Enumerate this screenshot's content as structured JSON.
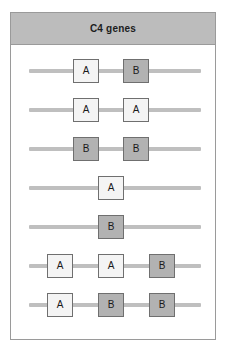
{
  "panel": {
    "title": "C4 genes",
    "header_color": "#bcbcbc",
    "border_color": "#9a9a9a",
    "background_color": "#ffffff"
  },
  "legend_colors": {
    "gene_A_fill": "#f4f4f4",
    "gene_B_fill": "#b2b2b2",
    "gene_border": "#6f6f6f",
    "chromosome_line": "#bfbfbf"
  },
  "chart_data": {
    "type": "diagram",
    "title": "C4 genes",
    "xlabel": "",
    "ylabel": "",
    "categories": [
      "haplotype-1",
      "haplotype-2",
      "haplotype-3",
      "haplotype-4",
      "haplotype-5",
      "haplotype-6",
      "haplotype-7"
    ],
    "haplotypes": [
      {
        "index": 1,
        "gene_count": 2,
        "genes": [
          {
            "label": "A",
            "type": "A",
            "left": 62
          },
          {
            "label": "B",
            "type": "B",
            "left": 112
          }
        ]
      },
      {
        "index": 2,
        "gene_count": 2,
        "genes": [
          {
            "label": "A",
            "type": "A",
            "left": 62
          },
          {
            "label": "A",
            "type": "A",
            "left": 112
          }
        ]
      },
      {
        "index": 3,
        "gene_count": 2,
        "genes": [
          {
            "label": "B",
            "type": "B",
            "left": 62
          },
          {
            "label": "B",
            "type": "B",
            "left": 112
          }
        ]
      },
      {
        "index": 4,
        "gene_count": 1,
        "genes": [
          {
            "label": "A",
            "type": "A",
            "left": 87
          }
        ]
      },
      {
        "index": 5,
        "gene_count": 1,
        "genes": [
          {
            "label": "B",
            "type": "B",
            "left": 87
          }
        ]
      },
      {
        "index": 6,
        "gene_count": 3,
        "genes": [
          {
            "label": "A",
            "type": "A",
            "left": 36
          },
          {
            "label": "A",
            "type": "A",
            "left": 87
          },
          {
            "label": "B",
            "type": "B",
            "left": 138
          }
        ]
      },
      {
        "index": 7,
        "gene_count": 3,
        "genes": [
          {
            "label": "A",
            "type": "A",
            "left": 36
          },
          {
            "label": "B",
            "type": "B",
            "left": 87
          },
          {
            "label": "B",
            "type": "B",
            "left": 138
          }
        ]
      }
    ]
  }
}
